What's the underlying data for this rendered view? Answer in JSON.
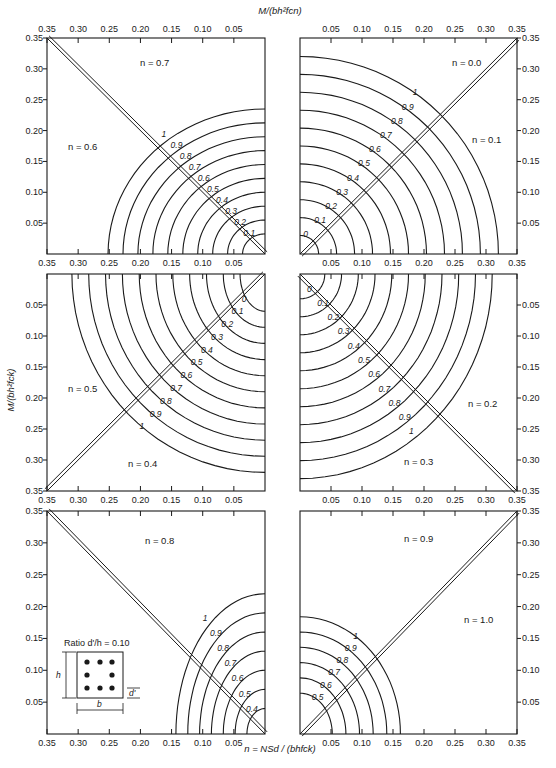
{
  "chart_data": {
    "type": "line",
    "top_axis_title": "M/(bh²fcn)",
    "left_axis_title": "M/(bh²fck)",
    "bottom_axis_title": "n = NSd / (bhfck)",
    "inset": {
      "label": "Ratio d'/h = 0.10",
      "dim_h": "h",
      "dim_b": "b",
      "dim_d": "d'"
    },
    "axis_range": [
      0,
      0.35
    ],
    "ticks": [
      "0.05",
      "0.10",
      "0.15",
      "0.20",
      "0.25",
      "0.30",
      "0.35"
    ],
    "curve_parameter": "ω (mechanical reinforcement ratio)",
    "panels": [
      {
        "id": "top-left",
        "n_values": [
          "n = 0.7",
          "n = 0.6"
        ],
        "curves": [
          "1",
          "0.9",
          "0.8",
          "0.7",
          "0.6",
          "0.5",
          "0.4",
          "0.3",
          "0.2",
          "0.1"
        ],
        "x_axis": "reversed",
        "y_axis": "up"
      },
      {
        "id": "top-right",
        "n_values": [
          "n = 0.0",
          "n = 0.1"
        ],
        "curves": [
          "1",
          "0.9",
          "0.8",
          "0.7",
          "0.6",
          "0.5",
          "0.4",
          "0.3",
          "0.2",
          "0.1",
          "0"
        ],
        "x_axis": "normal",
        "y_axis": "up"
      },
      {
        "id": "middle-left",
        "n_values": [
          "n = 0.5",
          "n = 0.4"
        ],
        "curves": [
          "0",
          "0.1",
          "0.2",
          "0.3",
          "0.4",
          "0.5",
          "0.6",
          "0.7",
          "0.8",
          "0.9",
          "1"
        ],
        "x_axis": "reversed",
        "y_axis": "down"
      },
      {
        "id": "middle-right",
        "n_values": [
          "n = 0.2",
          "n = 0.3"
        ],
        "curves": [
          "0",
          "0.1",
          "0.2",
          "0.3",
          "0.4",
          "0.5",
          "0.6",
          "0.7",
          "0.8",
          "0.9",
          "1"
        ],
        "x_axis": "normal",
        "y_axis": "down"
      },
      {
        "id": "bottom-left",
        "n_values": [
          "n = 0.8"
        ],
        "curves": [
          "1",
          "0.9",
          "0.8",
          "0.7",
          "0.6",
          "0.5",
          "0.4"
        ],
        "x_axis": "reversed",
        "y_axis": "up"
      },
      {
        "id": "bottom-right",
        "n_values": [
          "n = 0.9",
          "n = 1.0"
        ],
        "curves": [
          "1",
          "0.9",
          "0.8",
          "0.7",
          "0.6",
          "0.5"
        ],
        "x_axis": "normal",
        "y_axis": "up"
      }
    ],
    "grid": false
  },
  "labels": {
    "top_axis": "M/(bh²fcn)",
    "left_axis": "M/(bh²fck)",
    "bottom_axis": "n = NSd / (bhfck)",
    "inset_ratio": "Ratio d'/h = 0.10",
    "inset_h": "h",
    "inset_b": "b",
    "inset_d": "d'",
    "n07": "n = 0.7",
    "n06": "n = 0.6",
    "n00": "n = 0.0",
    "n01": "n = 0.1",
    "n05": "n = 0.5",
    "n04": "n = 0.4",
    "n02": "n = 0.2",
    "n03": "n = 0.3",
    "n08": "n = 0.8",
    "n09": "n = 0.9",
    "n10": "n = 1.0"
  }
}
